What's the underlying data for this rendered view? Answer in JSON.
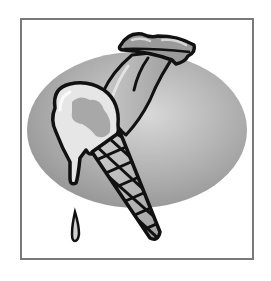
{
  "image": {
    "subject": "Tongue licking melting ice cream cone clipart",
    "elements": [
      "frame",
      "gray-ellipse-background",
      "lips",
      "tongue",
      "ice-cream-scoop",
      "waffle-cone",
      "drip-drop"
    ]
  },
  "colors": {
    "background": "#ffffff",
    "frame": "#7a7a7a",
    "ellipse_light": "#d8d8d8",
    "ellipse_dark": "#8e8e8e",
    "outline": "#111111",
    "scoop": "#e6e6e6",
    "scoop_shade": "#a8a8a8",
    "cone": "#bdbdbd",
    "tongue": "#b0b0b0",
    "lips": "#9a9a9a"
  }
}
